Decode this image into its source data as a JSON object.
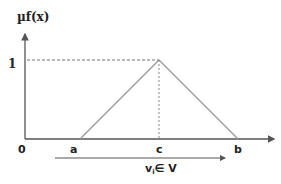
{
  "diagram": {
    "y_axis_label": "µf(x)",
    "y_tick_label": "1",
    "origin_label": "0",
    "x_points": {
      "a": "a",
      "c": "c",
      "b": "b"
    },
    "domain_label_main": "v",
    "domain_label_sub": "i",
    "domain_label_rest": "∈ V",
    "colors": {
      "axis": "#555555",
      "triangle": "#999999",
      "dashed": "#777777",
      "text": "#222222"
    }
  }
}
